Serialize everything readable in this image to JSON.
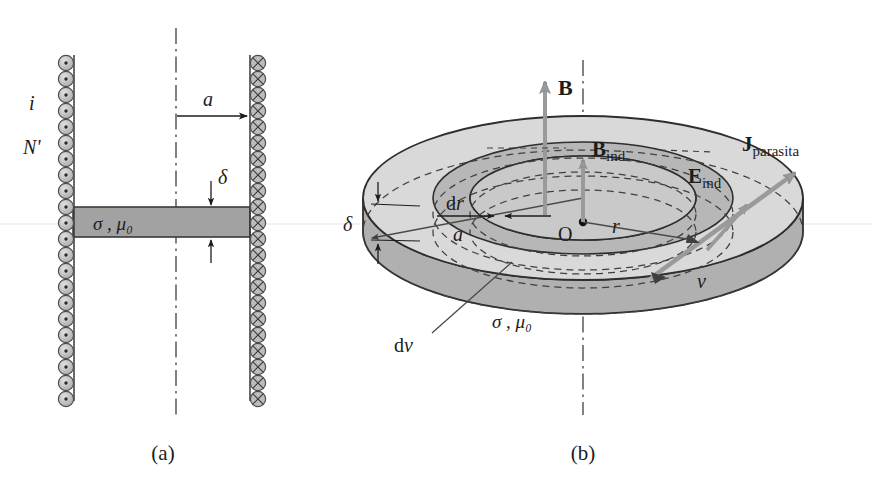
{
  "figure": {
    "domain": "physics-diagram",
    "panels": [
      {
        "id": "a",
        "caption": "(a)",
        "description": "cross-section of a solenoid-like coil pair with a conducting disc slab",
        "labels": {
          "current": "i",
          "turns": "N'",
          "radius": "a",
          "thickness": "δ",
          "material": "σ , μ₀"
        },
        "coil_left_icon": "dot-circle-icon",
        "coil_right_icon": "cross-circle-icon",
        "coil_turns_count": 22
      },
      {
        "id": "b",
        "caption": "(b)",
        "description": "3D perspective view of the conducting disc with induced fields",
        "labels": {
          "B": "B",
          "B_ind_base": "B",
          "B_ind_sub": "ind",
          "E_ind_base": "E",
          "E_ind_sub": "ind",
          "J_base": "J",
          "J_sub": "parasita",
          "origin": "O",
          "radius_r": "r",
          "radius_a": "a",
          "dr": "d",
          "dr_italic": "r",
          "thickness": "δ",
          "volume_elem_base": "d",
          "volume_elem_italic": "v",
          "volume": "v",
          "material": "σ , μ₀"
        }
      }
    ]
  },
  "colors": {
    "ink": "#1c1c1c",
    "coil_fill": "#b6b6b6",
    "coil_stroke": "#555555",
    "slab_fill": "#a2a2a2",
    "slab_stroke": "#3a3a3a",
    "disc_top": "#d8d8d8",
    "disc_ring": "#b9b9b9",
    "disc_side": "#b0b0b0",
    "disc_side_dark": "#a5a5a5",
    "arrow_gray": "#909090",
    "dash": "#4a4a4a",
    "background": "#ffffff"
  }
}
